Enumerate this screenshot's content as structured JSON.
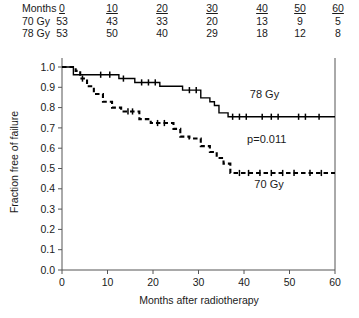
{
  "risk_table": {
    "row_label_header": "Months",
    "columns": [
      "0",
      "10",
      "20",
      "30",
      "40",
      "50",
      "60"
    ],
    "rows": [
      {
        "label": "70 Gy",
        "values": [
          "53",
          "43",
          "33",
          "20",
          "13",
          "9",
          "5"
        ]
      },
      {
        "label": "78 Gy",
        "values": [
          "53",
          "50",
          "40",
          "29",
          "18",
          "12",
          "8"
        ]
      }
    ]
  },
  "chart_data": {
    "type": "line",
    "subtype": "kaplan-meier-step",
    "title": "",
    "xlabel": "Months after radiotherapy",
    "ylabel": "Fraction free of failure",
    "xlim": [
      0,
      60
    ],
    "ylim": [
      0.0,
      1.0
    ],
    "xticks": [
      0,
      10,
      20,
      30,
      40,
      50,
      60
    ],
    "yticks": [
      "0.0",
      "0.1",
      "0.2",
      "0.3",
      "0.4",
      "0.5",
      "0.6",
      "0.7",
      "0.8",
      "0.9",
      "1.0"
    ],
    "grid": false,
    "legend_position": "inline-annotation",
    "annotations": [
      {
        "text": "78 Gy",
        "x": 44.5,
        "y": 0.845
      },
      {
        "text": "p=0.011",
        "x": 45.0,
        "y": 0.625
      },
      {
        "text": "70 Gy",
        "x": 45.5,
        "y": 0.405
      }
    ],
    "series": [
      {
        "name": "78 Gy",
        "style": "solid",
        "final_value": 0.755,
        "points": [
          [
            0,
            1.0
          ],
          [
            2.5,
            1.0
          ],
          [
            2.5,
            0.962
          ],
          [
            12.5,
            0.962
          ],
          [
            12.5,
            0.943
          ],
          [
            16.0,
            0.943
          ],
          [
            16.0,
            0.924
          ],
          [
            21.5,
            0.924
          ],
          [
            21.5,
            0.905
          ],
          [
            26.5,
            0.905
          ],
          [
            26.5,
            0.886
          ],
          [
            30.5,
            0.886
          ],
          [
            30.5,
            0.848
          ],
          [
            32.5,
            0.848
          ],
          [
            32.5,
            0.829
          ],
          [
            33.5,
            0.829
          ],
          [
            33.5,
            0.81
          ],
          [
            34.5,
            0.81
          ],
          [
            34.5,
            0.774
          ],
          [
            36.5,
            0.774
          ],
          [
            36.5,
            0.755
          ],
          [
            60,
            0.755
          ]
        ],
        "censor_points": [
          [
            8.5,
            0.962
          ],
          [
            10.5,
            0.962
          ],
          [
            13.5,
            0.943
          ],
          [
            17.5,
            0.924
          ],
          [
            19.0,
            0.924
          ],
          [
            20.5,
            0.924
          ],
          [
            28.0,
            0.886
          ],
          [
            29.5,
            0.886
          ],
          [
            37.5,
            0.755
          ],
          [
            39.0,
            0.755
          ],
          [
            40.5,
            0.755
          ],
          [
            44.0,
            0.755
          ],
          [
            46.0,
            0.755
          ],
          [
            47.5,
            0.755
          ],
          [
            52.0,
            0.755
          ],
          [
            53.5,
            0.755
          ],
          [
            56.5,
            0.755
          ]
        ]
      },
      {
        "name": "70 Gy",
        "style": "dashed",
        "final_value": 0.478,
        "points": [
          [
            0,
            1.0
          ],
          [
            3.0,
            1.0
          ],
          [
            3.0,
            0.981
          ],
          [
            4.0,
            0.981
          ],
          [
            4.0,
            0.943
          ],
          [
            5.5,
            0.943
          ],
          [
            5.5,
            0.905
          ],
          [
            7.0,
            0.905
          ],
          [
            7.0,
            0.867
          ],
          [
            9.0,
            0.867
          ],
          [
            9.0,
            0.829
          ],
          [
            11.0,
            0.829
          ],
          [
            11.0,
            0.8
          ],
          [
            13.0,
            0.8
          ],
          [
            13.0,
            0.781
          ],
          [
            17.0,
            0.781
          ],
          [
            17.0,
            0.743
          ],
          [
            19.5,
            0.743
          ],
          [
            19.5,
            0.724
          ],
          [
            24.5,
            0.724
          ],
          [
            24.5,
            0.695
          ],
          [
            26.0,
            0.695
          ],
          [
            26.0,
            0.657
          ],
          [
            28.0,
            0.657
          ],
          [
            28.0,
            0.648
          ],
          [
            30.5,
            0.648
          ],
          [
            30.5,
            0.61
          ],
          [
            32.5,
            0.61
          ],
          [
            32.5,
            0.581
          ],
          [
            34.0,
            0.581
          ],
          [
            34.0,
            0.552
          ],
          [
            35.5,
            0.552
          ],
          [
            35.5,
            0.524
          ],
          [
            37.0,
            0.524
          ],
          [
            37.0,
            0.478
          ],
          [
            60,
            0.478
          ]
        ],
        "censor_points": [
          [
            4.5,
            0.943
          ],
          [
            14.5,
            0.781
          ],
          [
            15.5,
            0.781
          ],
          [
            21.0,
            0.724
          ],
          [
            22.5,
            0.724
          ],
          [
            39.0,
            0.478
          ],
          [
            41.0,
            0.478
          ],
          [
            43.5,
            0.478
          ],
          [
            46.0,
            0.478
          ],
          [
            48.5,
            0.478
          ],
          [
            51.0,
            0.478
          ],
          [
            54.5,
            0.478
          ],
          [
            57.0,
            0.478
          ]
        ]
      }
    ]
  }
}
